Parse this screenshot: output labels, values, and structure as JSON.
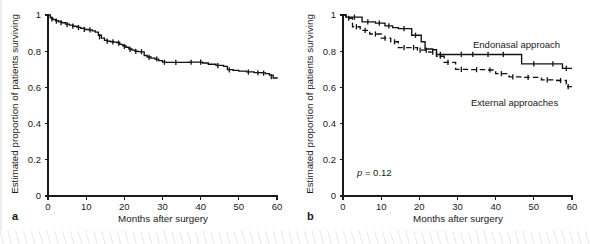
{
  "figure": {
    "panels": [
      {
        "letter": "a",
        "name": "overall-survival",
        "axes": {
          "ylabel": "Estimated proportion of patients surviving",
          "xlabel": "Months after surgery",
          "yticks": [
            "0",
            "0.2",
            "0.4",
            "0.6",
            "0.8",
            "1"
          ],
          "ytickvals": [
            0,
            0.2,
            0.4,
            0.6,
            0.8,
            1
          ],
          "xticks": [
            "0",
            "10",
            "20",
            "30",
            "40",
            "50",
            "60"
          ],
          "xtickvals": [
            0,
            10,
            20,
            30,
            40,
            50,
            60
          ]
        },
        "annotations": []
      },
      {
        "letter": "b",
        "name": "survival-by-approach",
        "axes": {
          "ylabel": "Estimated proportion of patients surviving",
          "xlabel": "Months after surgery",
          "yticks": [
            "0",
            "0.2",
            "0.4",
            "0.6",
            "0.8",
            "1"
          ],
          "ytickvals": [
            0,
            0.2,
            0.4,
            0.6,
            0.8,
            1
          ],
          "xticks": [
            "0",
            "10",
            "20",
            "30",
            "40",
            "50",
            "60"
          ],
          "xtickvals": [
            0,
            10,
            20,
            30,
            40,
            50,
            60
          ]
        },
        "annotations": [
          {
            "name": "endonasal-label",
            "text": "Endonasal approach"
          },
          {
            "name": "external-label",
            "text": "External approaches"
          },
          {
            "name": "p-value",
            "text_italic": "p",
            "text": " = 0.12"
          }
        ]
      }
    ]
  },
  "chart_data": [
    {
      "type": "line",
      "name": "panel-a-kaplan-meier",
      "title": "",
      "xlabel": "Months after surgery",
      "ylabel": "Estimated proportion of patients surviving",
      "xlim": [
        0,
        60
      ],
      "ylim": [
        0,
        1
      ],
      "grid": false,
      "legend": "none",
      "series": [
        {
          "name": "All patients",
          "style": "solid",
          "step": "post",
          "x": [
            0,
            0.6,
            1.2,
            2.0,
            2.8,
            3.6,
            4.6,
            5.6,
            6.6,
            7.6,
            8.6,
            9.6,
            10.6,
            11.6,
            12.4,
            13.2,
            14.0,
            14.8,
            15.6,
            16.4,
            17.2,
            18.0,
            18.8,
            19.6,
            20.4,
            21.2,
            22.0,
            22.8,
            23.6,
            24.4,
            25.2,
            26.0,
            27.0,
            28.0,
            29.0,
            30.0,
            31.0,
            33.0,
            35.0,
            37.0,
            39.0,
            40.5,
            42.0,
            44.0,
            46.0,
            47.0,
            48.5,
            50.0,
            52.0,
            54.0,
            56.0,
            57.0,
            58.0,
            59.0,
            60.0
          ],
          "y": [
            1.0,
            0.985,
            0.975,
            0.968,
            0.962,
            0.957,
            0.95,
            0.944,
            0.938,
            0.932,
            0.926,
            0.92,
            0.918,
            0.912,
            0.905,
            0.888,
            0.872,
            0.86,
            0.855,
            0.852,
            0.85,
            0.848,
            0.838,
            0.83,
            0.822,
            0.812,
            0.806,
            0.8,
            0.798,
            0.796,
            0.776,
            0.768,
            0.762,
            0.756,
            0.748,
            0.74,
            0.738,
            0.738,
            0.738,
            0.74,
            0.74,
            0.735,
            0.728,
            0.722,
            0.716,
            0.698,
            0.694,
            0.69,
            0.686,
            0.682,
            0.68,
            0.676,
            0.668,
            0.652,
            0.648
          ],
          "censored_x": [
            1.0,
            2.2,
            3.4,
            5.0,
            6.5,
            8.0,
            9.5,
            11.0,
            13.5,
            15.5,
            17.0,
            18.5,
            20.0,
            21.5,
            23.0,
            24.5,
            26.5,
            28.5,
            30.5,
            33.5,
            37.5,
            40.0,
            44.5,
            47.5,
            52.5,
            55.0,
            56.5,
            58.5
          ],
          "censored_y": [
            0.978,
            0.966,
            0.958,
            0.947,
            0.939,
            0.93,
            0.921,
            0.918,
            0.88,
            0.856,
            0.851,
            0.845,
            0.826,
            0.81,
            0.799,
            0.797,
            0.766,
            0.757,
            0.739,
            0.738,
            0.739,
            0.74,
            0.72,
            0.697,
            0.685,
            0.681,
            0.679,
            0.66
          ]
        }
      ]
    },
    {
      "type": "line",
      "name": "panel-b-kaplan-meier-by-approach",
      "title": "",
      "xlabel": "Months after surgery",
      "ylabel": "Estimated proportion of patients surviving",
      "xlim": [
        0,
        60
      ],
      "ylim": [
        0,
        1
      ],
      "grid": false,
      "legend": "inline-annotations",
      "pvalue": 0.12,
      "series": [
        {
          "name": "Endonasal approach",
          "style": "solid",
          "step": "post",
          "x": [
            0,
            0.8,
            5.0,
            5.0,
            8.5,
            8.5,
            11.0,
            11.0,
            13.0,
            13.0,
            14.5,
            14.5,
            18.0,
            18.0,
            20.5,
            20.5,
            21.5,
            21.5,
            23.5,
            23.5,
            24.5,
            24.5,
            28.5,
            28.5,
            46.8,
            46.8,
            57.5,
            57.5,
            60.0
          ],
          "y": [
            1.0,
            0.988,
            0.988,
            0.962,
            0.962,
            0.955,
            0.955,
            0.94,
            0.94,
            0.93,
            0.93,
            0.925,
            0.925,
            0.888,
            0.888,
            0.852,
            0.852,
            0.812,
            0.812,
            0.808,
            0.808,
            0.782,
            0.782,
            0.782,
            0.782,
            0.73,
            0.73,
            0.705,
            0.705
          ],
          "censored_x": [
            3.0,
            6.5,
            9.5,
            12.0,
            16.0,
            19.0,
            25.5,
            31.0,
            34.0,
            38.0,
            42.0,
            50.0,
            55.0,
            58.5
          ],
          "censored_y": [
            0.988,
            0.962,
            0.955,
            0.94,
            0.925,
            0.888,
            0.782,
            0.782,
            0.782,
            0.782,
            0.782,
            0.73,
            0.73,
            0.705
          ]
        },
        {
          "name": "External approaches",
          "style": "dashed",
          "step": "post",
          "x": [
            0,
            0.8,
            2.5,
            2.5,
            4.5,
            4.5,
            7.0,
            7.0,
            10.0,
            10.0,
            12.5,
            12.5,
            14.5,
            14.5,
            17.5,
            17.5,
            19.5,
            19.5,
            21.0,
            21.0,
            22.5,
            22.5,
            24.5,
            24.5,
            26.5,
            26.5,
            29.5,
            29.5,
            33.0,
            33.0,
            37.5,
            37.5,
            40.0,
            40.0,
            43.5,
            43.5,
            47.0,
            47.0,
            52.0,
            52.0,
            56.0,
            56.0,
            58.5,
            58.5,
            60.0
          ],
          "y": [
            1.0,
            0.982,
            0.982,
            0.935,
            0.935,
            0.915,
            0.915,
            0.895,
            0.895,
            0.872,
            0.872,
            0.852,
            0.852,
            0.82,
            0.82,
            0.82,
            0.82,
            0.806,
            0.806,
            0.806,
            0.806,
            0.795,
            0.795,
            0.772,
            0.772,
            0.738,
            0.738,
            0.7,
            0.7,
            0.698,
            0.698,
            0.696,
            0.696,
            0.676,
            0.676,
            0.658,
            0.658,
            0.655,
            0.655,
            0.642,
            0.642,
            0.638,
            0.638,
            0.604,
            0.604
          ],
          "censored_x": [
            1.5,
            3.5,
            5.8,
            8.5,
            11.0,
            13.5,
            16.0,
            18.5,
            20.2,
            21.8,
            23.5,
            25.5,
            27.5,
            31.0,
            35.0,
            38.5,
            41.5,
            44.5,
            48.5,
            53.5,
            57.0,
            59.0
          ],
          "censored_y": [
            0.982,
            0.935,
            0.915,
            0.895,
            0.872,
            0.852,
            0.82,
            0.82,
            0.806,
            0.806,
            0.795,
            0.772,
            0.738,
            0.7,
            0.698,
            0.696,
            0.676,
            0.658,
            0.655,
            0.642,
            0.638,
            0.604
          ]
        }
      ]
    }
  ]
}
